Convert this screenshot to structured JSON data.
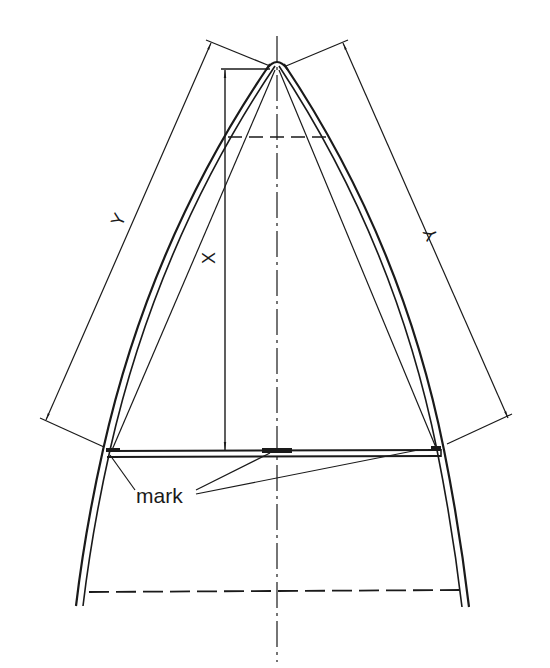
{
  "diagram": {
    "type": "technical-drawing",
    "colors": {
      "ink": "#1a1a1a",
      "background": "#ffffff"
    },
    "labels": {
      "x_dimension": "X",
      "y_left_dimension": "Y",
      "y_right_dimension": "Y",
      "mark": "mark"
    },
    "elements": [
      {
        "name": "centerline",
        "style": "dash-dot"
      },
      {
        "name": "arch-left",
        "style": "double-line"
      },
      {
        "name": "arch-right",
        "style": "double-line"
      },
      {
        "name": "inner-chords",
        "style": "thin"
      },
      {
        "name": "crossbar",
        "style": "double-line"
      },
      {
        "name": "top-dashed-line",
        "style": "dashed"
      },
      {
        "name": "bottom-dashed-line",
        "style": "dashed"
      },
      {
        "name": "dimension-x",
        "label": "X"
      },
      {
        "name": "dimension-y-left",
        "label": "Y"
      },
      {
        "name": "dimension-y-right",
        "label": "Y"
      },
      {
        "name": "mark-leaders",
        "count": 3
      }
    ]
  }
}
